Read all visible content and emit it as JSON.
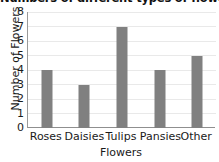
{
  "chart_data": {
    "type": "bar",
    "title": "Numbers of different types of flowers",
    "xlabel": "Flowers",
    "ylabel": "Number of Flowers",
    "categories": [
      "Roses",
      "Daisies",
      "Tulips",
      "Pansies",
      "Other"
    ],
    "values": [
      4,
      3,
      7,
      4,
      5
    ],
    "ylim": [
      0,
      8
    ],
    "yticks": [
      "0",
      "1",
      "2",
      "3",
      "4",
      "5",
      "6",
      "7",
      "8"
    ],
    "grid": true,
    "legend": false,
    "bar_color": "#808080",
    "grid_color": "#e9e9e9",
    "axis_color": "#8f8f8f",
    "background": "#ffffff"
  }
}
